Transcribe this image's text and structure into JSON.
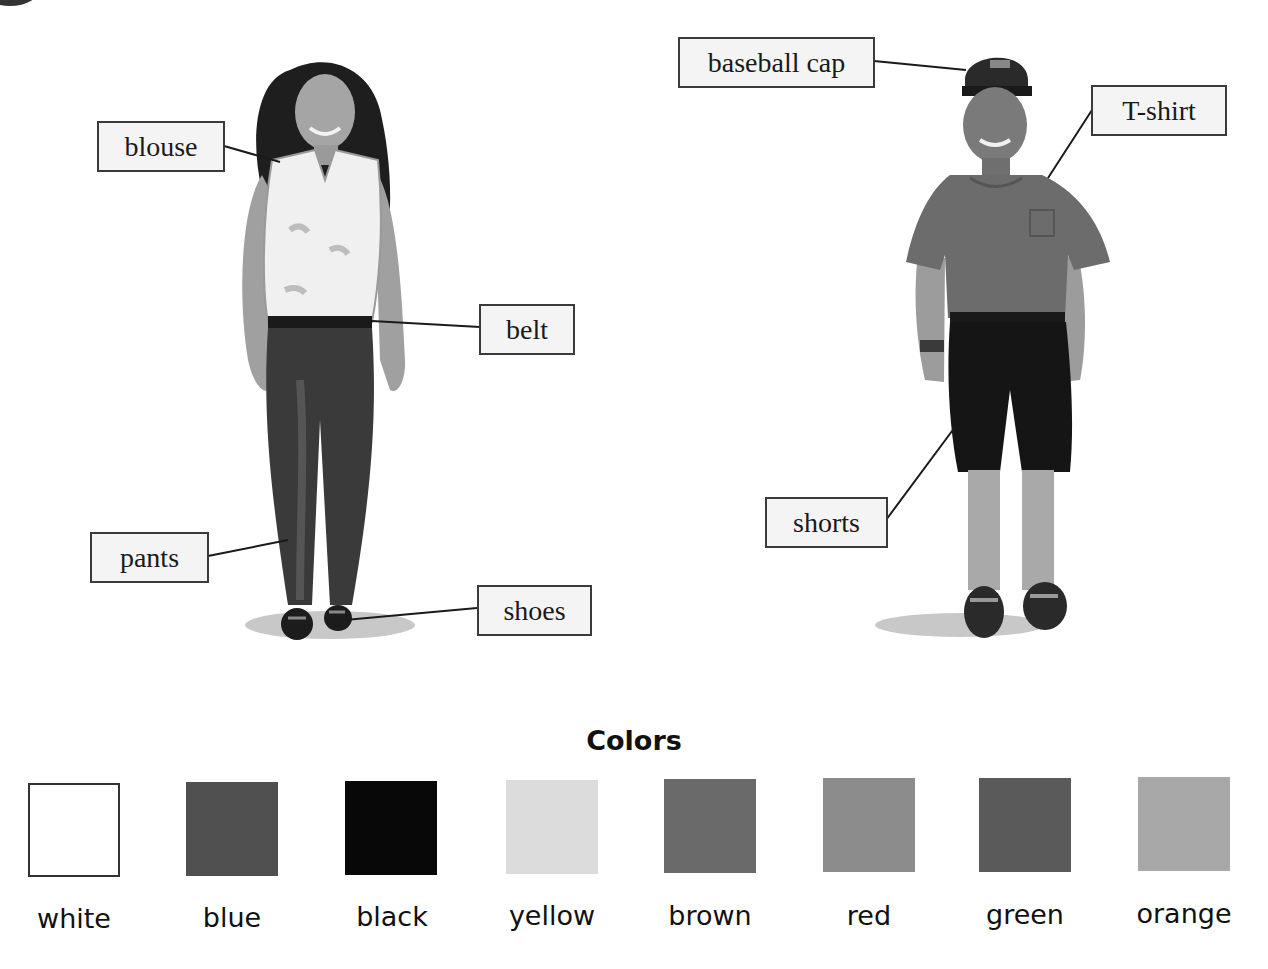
{
  "figures": {
    "woman": {
      "labels": {
        "blouse": "blouse",
        "belt": "belt",
        "pants": "pants",
        "shoes": "shoes"
      }
    },
    "man": {
      "labels": {
        "baseball_cap": "baseball cap",
        "tshirt": "T-shirt",
        "shorts": "shorts"
      }
    }
  },
  "colors_section": {
    "title": "Colors",
    "swatches": [
      {
        "name": "white",
        "hex": "#ffffff"
      },
      {
        "name": "blue",
        "hex": "#505050"
      },
      {
        "name": "black",
        "hex": "#080808"
      },
      {
        "name": "yellow",
        "hex": "#dcdcdc"
      },
      {
        "name": "brown",
        "hex": "#6a6a6a"
      },
      {
        "name": "red",
        "hex": "#8c8c8c"
      },
      {
        "name": "green",
        "hex": "#5a5a5a"
      },
      {
        "name": "orange",
        "hex": "#a8a8a8"
      }
    ]
  }
}
